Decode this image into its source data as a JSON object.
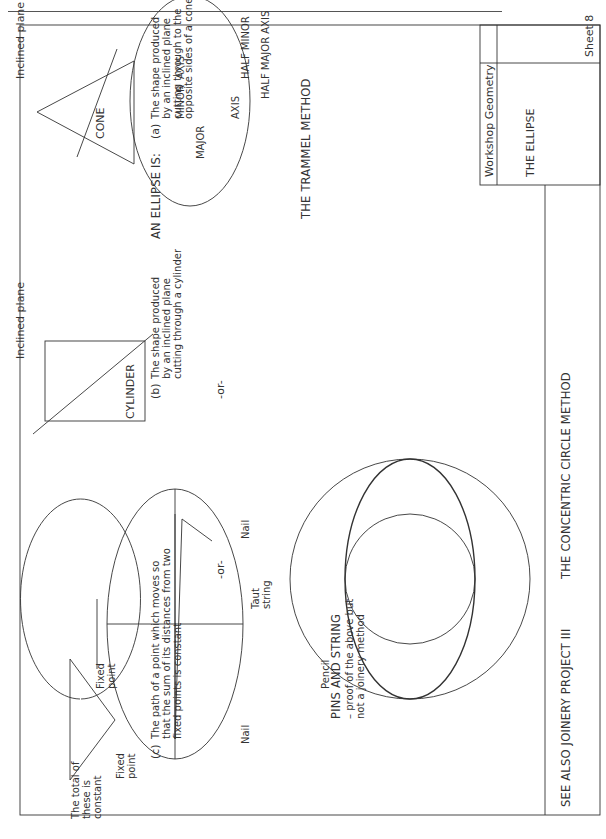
{
  "title_block": {
    "subject": "Workshop Geometry",
    "title": "THE ELLIPSE",
    "sheet": "Sheet 8"
  },
  "intro": {
    "lead": "AN ELLIPSE IS:",
    "separator": "-or-"
  },
  "definitions": [
    {
      "marker": "(a)",
      "text": "The shape produced\nby an inclined plane\ncutting through to the\nopposite sides of a cone",
      "figure_label": "CONE",
      "plane_label": "Inclined plane"
    },
    {
      "marker": "(b)",
      "text": "The shape produced\nby an inclined plane\ncutting through a cylinder",
      "figure_label": "CYLINDER",
      "plane_label": "Inclined plane"
    },
    {
      "marker": "(c)",
      "text": "The path of a point which moves so\nthat the sum of its distances from two\nfixed points is constant",
      "labels": {
        "total": "The total of\nthese is\nconstant",
        "fixed_point_1": "Fixed\npoint",
        "fixed_point_2": "Fixed\npoint"
      }
    }
  ],
  "methods": {
    "trammel": {
      "caption": "THE TRAMMEL METHOD",
      "labels": {
        "major": "MAJOR",
        "axis_1": "AXIS",
        "axis_2": "AXIS",
        "minor": "MINOR",
        "half_minor": "HALF MINOR",
        "half_major": "HALF MAJOR AXIS"
      }
    },
    "concentric": {
      "caption": "THE CONCENTRIC CIRCLE METHOD"
    },
    "pins_and_string": {
      "title": "PINS AND STRING",
      "subtitle": "– proof of the above but\nnot a joinery method",
      "labels": {
        "nail_1": "Nail",
        "nail_2": "Nail",
        "taut_string": "Taut\nstring",
        "pencil": "Pencil"
      }
    }
  },
  "footer": {
    "see_also": "SEE ALSO JOINERY PROJECT III"
  },
  "colors": {
    "ink": "#333333",
    "paper": "#ffffff"
  }
}
